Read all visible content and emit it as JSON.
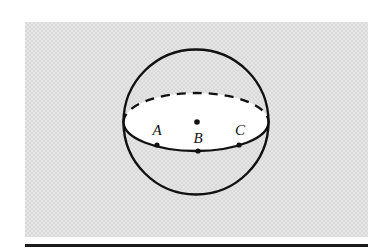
{
  "figure": {
    "panel": {
      "background_color": "#d9d9d9",
      "texture": "halftone-screen"
    },
    "rule": {
      "name": "horizontal-rule-bar",
      "color": "#1a1a1a"
    },
    "sphere": {
      "outline_color": "#111111",
      "center_dot_label": "",
      "equator_fill": "#ffffff",
      "back_arc_style": "dashed",
      "front_arc_style": "solid"
    },
    "points": [
      {
        "id": "A",
        "label": "A"
      },
      {
        "id": "B",
        "label": "B"
      },
      {
        "id": "C",
        "label": "C"
      }
    ]
  }
}
